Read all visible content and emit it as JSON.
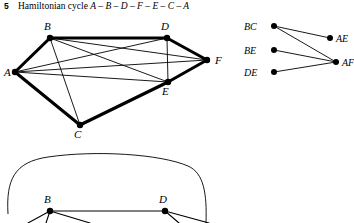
{
  "header": {
    "number": "5",
    "prefix": "Hamiltonian cycle ",
    "cycle": "A – B – D – F – E – C – A",
    "full_text": "Hamiltonian cycle A – B – D – F – E – C – A"
  },
  "colors": {
    "ink": "#000000",
    "background": "#ffffff"
  },
  "main_graph": {
    "vertices": [
      {
        "id": "A",
        "label": "A",
        "x": 15,
        "y": 56,
        "lx": 4,
        "ly": 60
      },
      {
        "id": "B",
        "label": "B",
        "x": 50,
        "y": 22,
        "lx": 44,
        "ly": 14
      },
      {
        "id": "C",
        "label": "C",
        "x": 80,
        "y": 109,
        "lx": 74,
        "ly": 122
      },
      {
        "id": "D",
        "label": "D",
        "x": 167,
        "y": 22,
        "lx": 161,
        "ly": 14
      },
      {
        "id": "E",
        "label": "E",
        "x": 168,
        "y": 66,
        "lx": 162,
        "ly": 79
      },
      {
        "id": "F",
        "label": "F",
        "x": 207,
        "y": 44,
        "lx": 215,
        "ly": 48
      }
    ],
    "cycle_edges": [
      {
        "from": "A",
        "to": "B"
      },
      {
        "from": "B",
        "to": "D"
      },
      {
        "from": "D",
        "to": "F"
      },
      {
        "from": "F",
        "to": "E"
      },
      {
        "from": "E",
        "to": "C"
      },
      {
        "from": "C",
        "to": "A"
      }
    ],
    "chord_edges": [
      {
        "from": "A",
        "to": "D"
      },
      {
        "from": "A",
        "to": "E"
      },
      {
        "from": "A",
        "to": "F"
      },
      {
        "from": "B",
        "to": "E"
      },
      {
        "from": "B",
        "to": "F"
      },
      {
        "from": "B",
        "to": "C"
      },
      {
        "from": "D",
        "to": "E"
      }
    ]
  },
  "bipartite_graph": {
    "left_nodes": [
      {
        "id": "BC",
        "label": "BC",
        "x": 38,
        "y": 12
      },
      {
        "id": "BE",
        "label": "BE",
        "x": 38,
        "y": 36
      },
      {
        "id": "DE",
        "label": "DE",
        "x": 38,
        "y": 58
      }
    ],
    "right_nodes": [
      {
        "id": "AE",
        "label": "AE",
        "x": 94,
        "y": 24
      },
      {
        "id": "AF",
        "label": "AF",
        "x": 100,
        "y": 48
      }
    ],
    "edges": [
      {
        "from": "BC",
        "to": "AE"
      },
      {
        "from": "BC",
        "to": "AF"
      },
      {
        "from": "BE",
        "to": "AF"
      },
      {
        "from": "DE",
        "to": "AF"
      }
    ]
  },
  "bottom_graph": {
    "vertices": [
      {
        "id": "B",
        "label": "B",
        "x": 50,
        "y": 59,
        "lx": 44,
        "ly": 51
      },
      {
        "id": "D",
        "label": "D",
        "x": 165,
        "y": 59,
        "lx": 159,
        "ly": 51
      }
    ],
    "edges": [
      {
        "from": "B",
        "to": "D"
      }
    ],
    "partial_edges_from_B": 3,
    "partial_edges_from_D": 2,
    "outline": "rounded enclosing curve"
  }
}
